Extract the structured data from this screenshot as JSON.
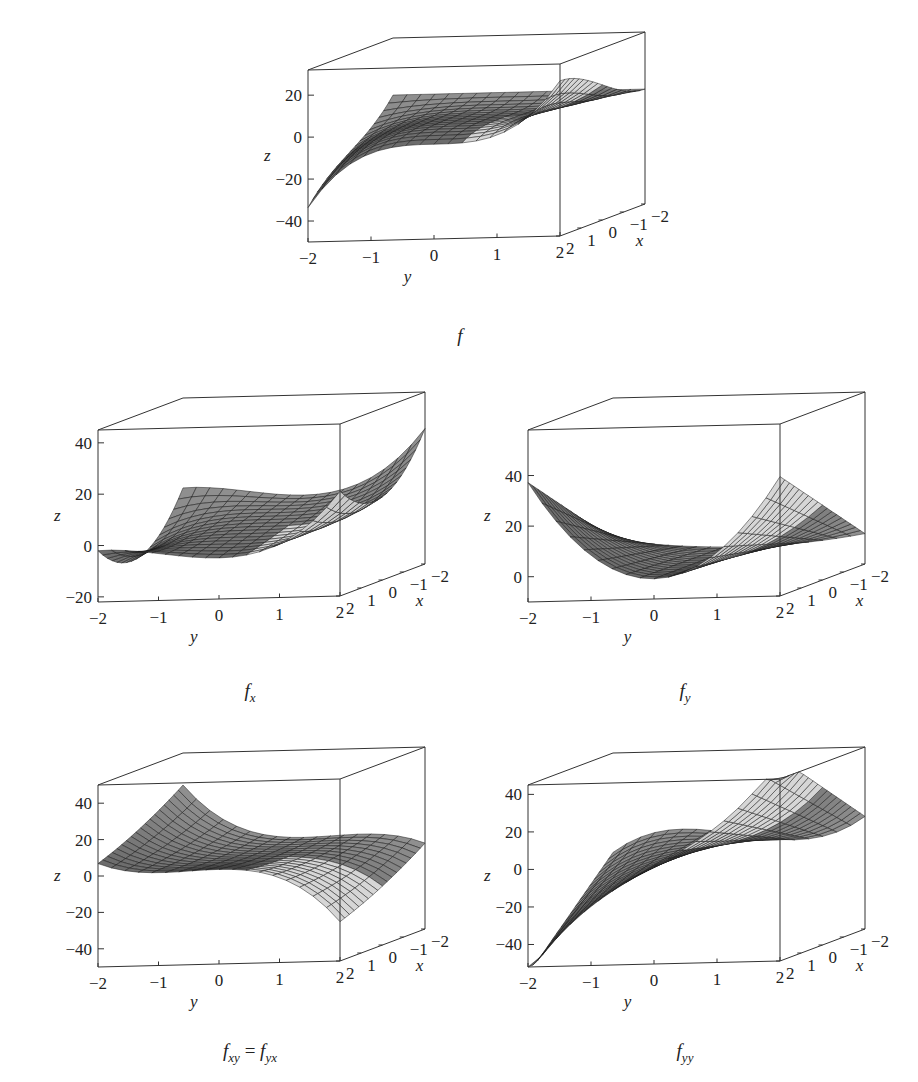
{
  "figure": {
    "panels": [
      {
        "id": "f",
        "caption": "f",
        "caption_sub": ""
      },
      {
        "id": "fx",
        "caption": "f",
        "caption_sub": "x"
      },
      {
        "id": "fy",
        "caption": "f",
        "caption_sub": "y"
      },
      {
        "id": "fxy",
        "caption": "f",
        "caption_sub": "xy",
        "caption_eq": " = ",
        "caption2": "f",
        "caption2_sub": "yx"
      },
      {
        "id": "fyy",
        "caption": "f",
        "caption_sub": "yy"
      }
    ]
  },
  "chart_data": [
    {
      "type": "surface3d",
      "title": "f",
      "xlabel": "x",
      "ylabel": "y",
      "zlabel": "z",
      "x_ticks": [
        "-2",
        "-1",
        "0",
        "1",
        "2"
      ],
      "y_ticks": [
        "-2",
        "-1",
        "0",
        "1",
        "2"
      ],
      "z_ticks": [
        "-40",
        "-20",
        "0",
        "20"
      ],
      "xlim": [
        -2,
        2
      ],
      "ylim": [
        -2,
        2
      ],
      "zlim": [
        -50,
        32
      ],
      "annotations": {
        "min_corner_z": -32,
        "dip_near_y_-0.5": -30,
        "max_corner_z": 27
      }
    },
    {
      "type": "surface3d",
      "title": "f_x",
      "xlabel": "x",
      "ylabel": "y",
      "zlabel": "z",
      "x_ticks": [
        "-2",
        "-1",
        "0",
        "1",
        "2"
      ],
      "y_ticks": [
        "-2",
        "-1",
        "0",
        "1",
        "2"
      ],
      "z_ticks": [
        "-20",
        "0",
        "20",
        "40"
      ],
      "xlim": [
        -2,
        2
      ],
      "ylim": [
        -2,
        2
      ],
      "zlim": [
        -22,
        45
      ],
      "annotations": {
        "peak_back_left": 56,
        "peak_front_right": 40,
        "min_corner_z": -20
      }
    },
    {
      "type": "surface3d",
      "title": "f_y",
      "xlabel": "x",
      "ylabel": "y",
      "zlabel": "z",
      "x_ticks": [
        "-2",
        "-1",
        "0",
        "1",
        "2"
      ],
      "y_ticks": [
        "-2",
        "-1",
        "0",
        "1",
        "2"
      ],
      "z_ticks": [
        "0",
        "20",
        "40"
      ],
      "xlim": [
        -2,
        2
      ],
      "ylim": [
        -2,
        2
      ],
      "zlim": [
        -10,
        58
      ],
      "annotations": {
        "peak_left": 56,
        "peak_back": 60,
        "peak_right": 50,
        "min_z": -3
      }
    },
    {
      "type": "surface3d",
      "title": "f_xy = f_yx",
      "xlabel": "x",
      "ylabel": "y",
      "zlabel": "z",
      "x_ticks": [
        "-2",
        "-1",
        "0",
        "1",
        "2"
      ],
      "y_ticks": [
        "-2",
        "-1",
        "0",
        "1",
        "2"
      ],
      "z_ticks": [
        "-40",
        "-20",
        "0",
        "20",
        "40"
      ],
      "xlim": [
        -2,
        2
      ],
      "ylim": [
        -2,
        2
      ],
      "zlim": [
        -50,
        50
      ],
      "annotations": {
        "max_corner_z": 48,
        "dip": -26,
        "min_corner_z": -33,
        "front_right_peak": 42
      }
    },
    {
      "type": "surface3d",
      "title": "f_yy",
      "xlabel": "x",
      "ylabel": "y",
      "zlabel": "z",
      "x_ticks": [
        "-2",
        "-1",
        "0",
        "1",
        "2"
      ],
      "y_ticks": [
        "-2",
        "-1",
        "0",
        "1",
        "2"
      ],
      "z_ticks": [
        "-40",
        "-20",
        "0",
        "20",
        "40"
      ],
      "xlim": [
        -2,
        2
      ],
      "ylim": [
        -2,
        2
      ],
      "zlim": [
        -52,
        45
      ],
      "annotations": {
        "min_corner_z": -50,
        "max_corner_z": 48,
        "step_dip": -30
      }
    }
  ]
}
